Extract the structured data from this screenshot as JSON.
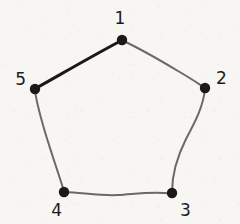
{
  "figure": {
    "background_color": "#f7f6f3",
    "ink_color_dark": "#1a1918",
    "ink_color_light": "#6f6d6a",
    "width": 240,
    "height": 224
  },
  "vertices": [
    {
      "id": "v1",
      "label": "1",
      "x": 122,
      "y": 40,
      "radius": 5.2,
      "label_x": 120,
      "label_y": 24,
      "label_anchor": "middle"
    },
    {
      "id": "v2",
      "label": "2",
      "x": 205,
      "y": 88,
      "radius": 5.2,
      "label_x": 216,
      "label_y": 84,
      "label_anchor": "start"
    },
    {
      "id": "v3",
      "label": "3",
      "x": 172,
      "y": 193,
      "radius": 5.2,
      "label_x": 180,
      "label_y": 216,
      "label_anchor": "start"
    },
    {
      "id": "v4",
      "label": "4",
      "x": 64,
      "y": 192,
      "radius": 5.2,
      "label_x": 62,
      "label_y": 216,
      "label_anchor": "end"
    },
    {
      "id": "v5",
      "label": "5",
      "x": 35,
      "y": 89,
      "radius": 5.2,
      "label_x": 26,
      "label_y": 85,
      "label_anchor": "end"
    }
  ],
  "edges": [
    {
      "id": "e51",
      "from": "5",
      "to": "1",
      "emphasis": "bold",
      "stroke": "#1a1918",
      "stroke_width": 3.1,
      "path": "M 35.5 88.5 C 58 76, 92 56, 121.5 40.5"
    },
    {
      "id": "e12",
      "from": "1",
      "to": "2",
      "emphasis": "normal",
      "stroke": "#6b6966",
      "stroke_width": 2.0,
      "path": "M 122.5 40.5 C 143 50, 163 62, 178 71 C 190 78, 199 84, 204.5 87.5"
    },
    {
      "id": "e23",
      "from": "2",
      "to": "3",
      "emphasis": "normal",
      "stroke": "#6b6966",
      "stroke_width": 2.0,
      "path": "M 205 89 C 203 108, 194 124, 186 139 C 178 155, 172 171, 172 192"
    },
    {
      "id": "e34",
      "from": "3",
      "to": "4",
      "emphasis": "normal",
      "stroke": "#6b6966",
      "stroke_width": 2.0,
      "path": "M 171 193.5 C 152 191, 135 194, 118 195 C 100 196, 82 192.5, 64.5 192"
    },
    {
      "id": "e45",
      "from": "4",
      "to": "5",
      "emphasis": "normal",
      "stroke": "#6b6966",
      "stroke_width": 2.0,
      "path": "M 64 191 C 58 172, 51 152, 45 132 C 40 115, 36 101, 35 90"
    }
  ],
  "shape": {
    "name": "pentagon",
    "sides": 5,
    "vertex_count": 5,
    "closed": true,
    "highlighted_edge": "5-1"
  }
}
